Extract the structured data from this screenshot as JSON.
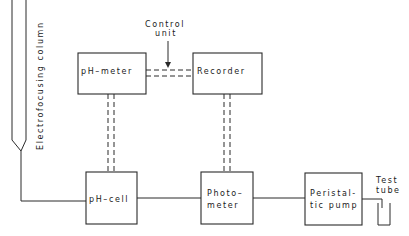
{
  "diagram": {
    "type": "block-diagram",
    "column": {
      "label": "Electrofocusing column"
    },
    "control_unit": {
      "line1": "Control",
      "line2": "unit"
    },
    "blocks": {
      "ph_meter": {
        "label": "pH–meter"
      },
      "recorder": {
        "label": "Recorder"
      },
      "ph_cell": {
        "label": "pH–cell"
      },
      "photometer": {
        "line1": "Photo–",
        "line2": "meter"
      },
      "pump": {
        "line1": "Peristal-",
        "line2": "tic pump"
      }
    },
    "test_tube": {
      "line1": "Test",
      "line2": "tube"
    },
    "connections": [
      {
        "from": "Electrofocusing column",
        "to": "pH-cell",
        "style": "solid"
      },
      {
        "from": "pH-cell",
        "to": "Photometer",
        "style": "solid"
      },
      {
        "from": "Photometer",
        "to": "Peristaltic pump",
        "style": "solid"
      },
      {
        "from": "Peristaltic pump",
        "to": "Test tube",
        "style": "solid"
      },
      {
        "from": "pH-cell",
        "to": "pH-meter",
        "style": "dashed-double"
      },
      {
        "from": "Photometer",
        "to": "Recorder",
        "style": "dashed-double"
      },
      {
        "from": "pH-meter",
        "to": "Recorder",
        "style": "dashed-double",
        "via": "Control unit"
      }
    ]
  }
}
